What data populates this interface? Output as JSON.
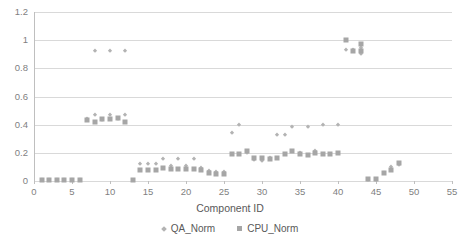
{
  "chart_data": {
    "type": "scatter",
    "title": "",
    "xlabel": "Component ID",
    "ylabel": "",
    "xlim": [
      0,
      55
    ],
    "ylim": [
      0,
      1.2
    ],
    "xticks": [
      0,
      5,
      10,
      15,
      20,
      25,
      30,
      35,
      40,
      45,
      50,
      55
    ],
    "xtick_labels": [
      "0",
      "5",
      "10",
      "15",
      "20",
      "25",
      "30",
      "35",
      "40",
      "45",
      "50",
      "55"
    ],
    "yticks": [
      0,
      0.2,
      0.4,
      0.6,
      0.8,
      1,
      1.2
    ],
    "ytick_labels": [
      "0",
      "0.2",
      "0.4",
      "0.6",
      "0.8",
      "1",
      "1.2"
    ],
    "grid": "horizontal",
    "legend_position": "bottom-center",
    "colors": {
      "qa_norm": "#b3b3b3",
      "cpu_norm": "#a6a6a6",
      "gridline": "#d9d9d9",
      "text": "#7f7f7f"
    },
    "series": [
      {
        "name": "QA_Norm",
        "marker": "diamond",
        "color": "#b3b3b3",
        "points": [
          [
            1,
            0.005
          ],
          [
            2,
            0.005
          ],
          [
            3,
            0.005
          ],
          [
            4,
            0.005
          ],
          [
            5,
            0.005
          ],
          [
            6,
            0.005
          ],
          [
            7,
            0.44
          ],
          [
            8,
            0.47
          ],
          [
            8,
            0.92
          ],
          [
            9,
            0.43
          ],
          [
            10,
            0.47
          ],
          [
            10,
            0.92
          ],
          [
            11,
            0.44
          ],
          [
            12,
            0.47
          ],
          [
            12,
            0.92
          ],
          [
            14,
            0.12
          ],
          [
            15,
            0.12
          ],
          [
            16,
            0.12
          ],
          [
            17,
            0.155
          ],
          [
            18,
            0.11
          ],
          [
            19,
            0.155
          ],
          [
            20,
            0.11
          ],
          [
            21,
            0.155
          ],
          [
            22,
            0.09
          ],
          [
            23,
            0.07
          ],
          [
            24,
            0.065
          ],
          [
            25,
            0.065
          ],
          [
            26,
            0.34
          ],
          [
            27,
            0.4
          ],
          [
            28,
            0.2
          ],
          [
            29,
            0.15
          ],
          [
            30,
            0.145
          ],
          [
            31,
            0.16
          ],
          [
            32,
            0.33
          ],
          [
            33,
            0.33
          ],
          [
            34,
            0.385
          ],
          [
            35,
            0.2
          ],
          [
            36,
            0.385
          ],
          [
            37,
            0.215
          ],
          [
            38,
            0.4
          ],
          [
            40,
            0.4
          ],
          [
            41,
            0.93
          ],
          [
            42,
            0.93
          ],
          [
            43,
            0.945
          ],
          [
            43,
            0.9
          ],
          [
            44,
            0.01
          ],
          [
            45,
            0.01
          ],
          [
            46,
            0.06
          ],
          [
            47,
            0.1
          ],
          [
            47,
            0.075
          ],
          [
            48,
            0.115
          ]
        ]
      },
      {
        "name": "CPU_Norm",
        "marker": "square",
        "color": "#a6a6a6",
        "points": [
          [
            1,
            0.005
          ],
          [
            2,
            0.005
          ],
          [
            3,
            0.005
          ],
          [
            4,
            0.005
          ],
          [
            5,
            0.005
          ],
          [
            6,
            0.005
          ],
          [
            7,
            0.43
          ],
          [
            8,
            0.42
          ],
          [
            9,
            0.44
          ],
          [
            10,
            0.44
          ],
          [
            11,
            0.45
          ],
          [
            12,
            0.42
          ],
          [
            13,
            0.005
          ],
          [
            14,
            0.08
          ],
          [
            15,
            0.075
          ],
          [
            16,
            0.075
          ],
          [
            17,
            0.09
          ],
          [
            18,
            0.085
          ],
          [
            19,
            0.085
          ],
          [
            20,
            0.085
          ],
          [
            21,
            0.085
          ],
          [
            22,
            0.08
          ],
          [
            23,
            0.055
          ],
          [
            24,
            0.05
          ],
          [
            25,
            0.05
          ],
          [
            26,
            0.19
          ],
          [
            27,
            0.195
          ],
          [
            28,
            0.21
          ],
          [
            29,
            0.165
          ],
          [
            30,
            0.16
          ],
          [
            31,
            0.155
          ],
          [
            32,
            0.165
          ],
          [
            33,
            0.195
          ],
          [
            34,
            0.21
          ],
          [
            35,
            0.195
          ],
          [
            36,
            0.185
          ],
          [
            37,
            0.2
          ],
          [
            38,
            0.195
          ],
          [
            39,
            0.195
          ],
          [
            40,
            0.2
          ],
          [
            41,
            1.0
          ],
          [
            42,
            0.92
          ],
          [
            43,
            0.975
          ],
          [
            43,
            0.92
          ],
          [
            44,
            0.015
          ],
          [
            45,
            0.015
          ],
          [
            46,
            0.06
          ],
          [
            47,
            0.075
          ],
          [
            48,
            0.13
          ]
        ]
      }
    ]
  },
  "legend": {
    "items": [
      {
        "label": "QA_Norm",
        "marker": "diamond"
      },
      {
        "label": "CPU_Norm",
        "marker": "square"
      }
    ]
  }
}
